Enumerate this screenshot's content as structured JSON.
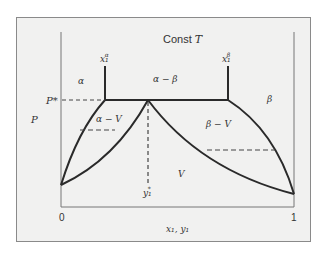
{
  "diagram": {
    "title": "Const T",
    "title_prefix": "Const ",
    "title_var": "T",
    "axes": {
      "y_label": "P",
      "x_label": "x₁, y₁",
      "x_ticks": [
        "0",
        "1"
      ],
      "p_star_label": "P*"
    },
    "markers": {
      "x_alpha": "x₁",
      "x_alpha_sup": "α",
      "x_beta": "x₁",
      "x_beta_sup": "β",
      "y_star": "y₁",
      "y_star_sup": "*"
    },
    "regions": {
      "alpha": "α",
      "alpha_beta": "α − β",
      "beta": "β",
      "alpha_v": "α − V",
      "beta_v": "β − V",
      "vapor": "V"
    },
    "colors": {
      "background": "#f1f1f0",
      "line": "#2a2a2a",
      "axis": "#777777"
    }
  }
}
